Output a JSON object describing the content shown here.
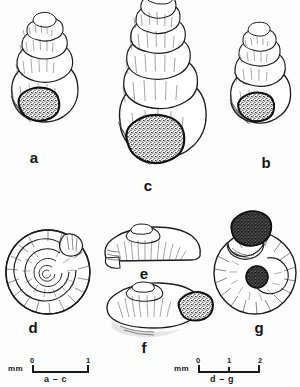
{
  "plate": {
    "kind": "scientific-illustration-plate",
    "subject": "gastropod shells",
    "background_color": "#fdfdfd",
    "ink_color": "#1a1a1a",
    "figure_count": 7
  },
  "figures": [
    {
      "id": "a",
      "label": "a",
      "view": "apertural",
      "form": "conical-spire",
      "whorls": 5,
      "aperture": "stippled",
      "scale_group": "a - c"
    },
    {
      "id": "b",
      "label": "b",
      "view": "apertural",
      "form": "conical-spire",
      "whorls": 5,
      "aperture": "stippled",
      "scale_group": "a - c"
    },
    {
      "id": "c",
      "label": "c",
      "view": "apertural",
      "form": "elongate-conical-spire",
      "whorls": 7,
      "aperture": "stippled",
      "scale_group": "a - c"
    },
    {
      "id": "d",
      "label": "d",
      "view": "dorsal",
      "form": "planispiral-discoid",
      "whorls": 4,
      "aperture": "open",
      "scale_group": "d - g"
    },
    {
      "id": "e",
      "label": "e",
      "view": "lateral",
      "form": "depressed-lenticular",
      "whorls": 3,
      "aperture": "open",
      "scale_group": "d - g"
    },
    {
      "id": "f",
      "label": "f",
      "view": "apertural",
      "form": "depressed-lenticular",
      "whorls": 3,
      "aperture": "stippled",
      "scale_group": "d - g"
    },
    {
      "id": "g",
      "label": "g",
      "view": "umbilical",
      "form": "planispiral-discoid",
      "whorls": 4,
      "aperture": "stippled-dark",
      "scale_group": "d - g"
    }
  ],
  "scale_bars": [
    {
      "id": "left",
      "unit": "mm",
      "ticks": [
        "0",
        "1"
      ],
      "caption": "a – c",
      "span_mm": 1
    },
    {
      "id": "right",
      "unit": "mm",
      "ticks": [
        "0",
        "1",
        "2"
      ],
      "caption": "d – g",
      "span_mm": 2
    }
  ]
}
